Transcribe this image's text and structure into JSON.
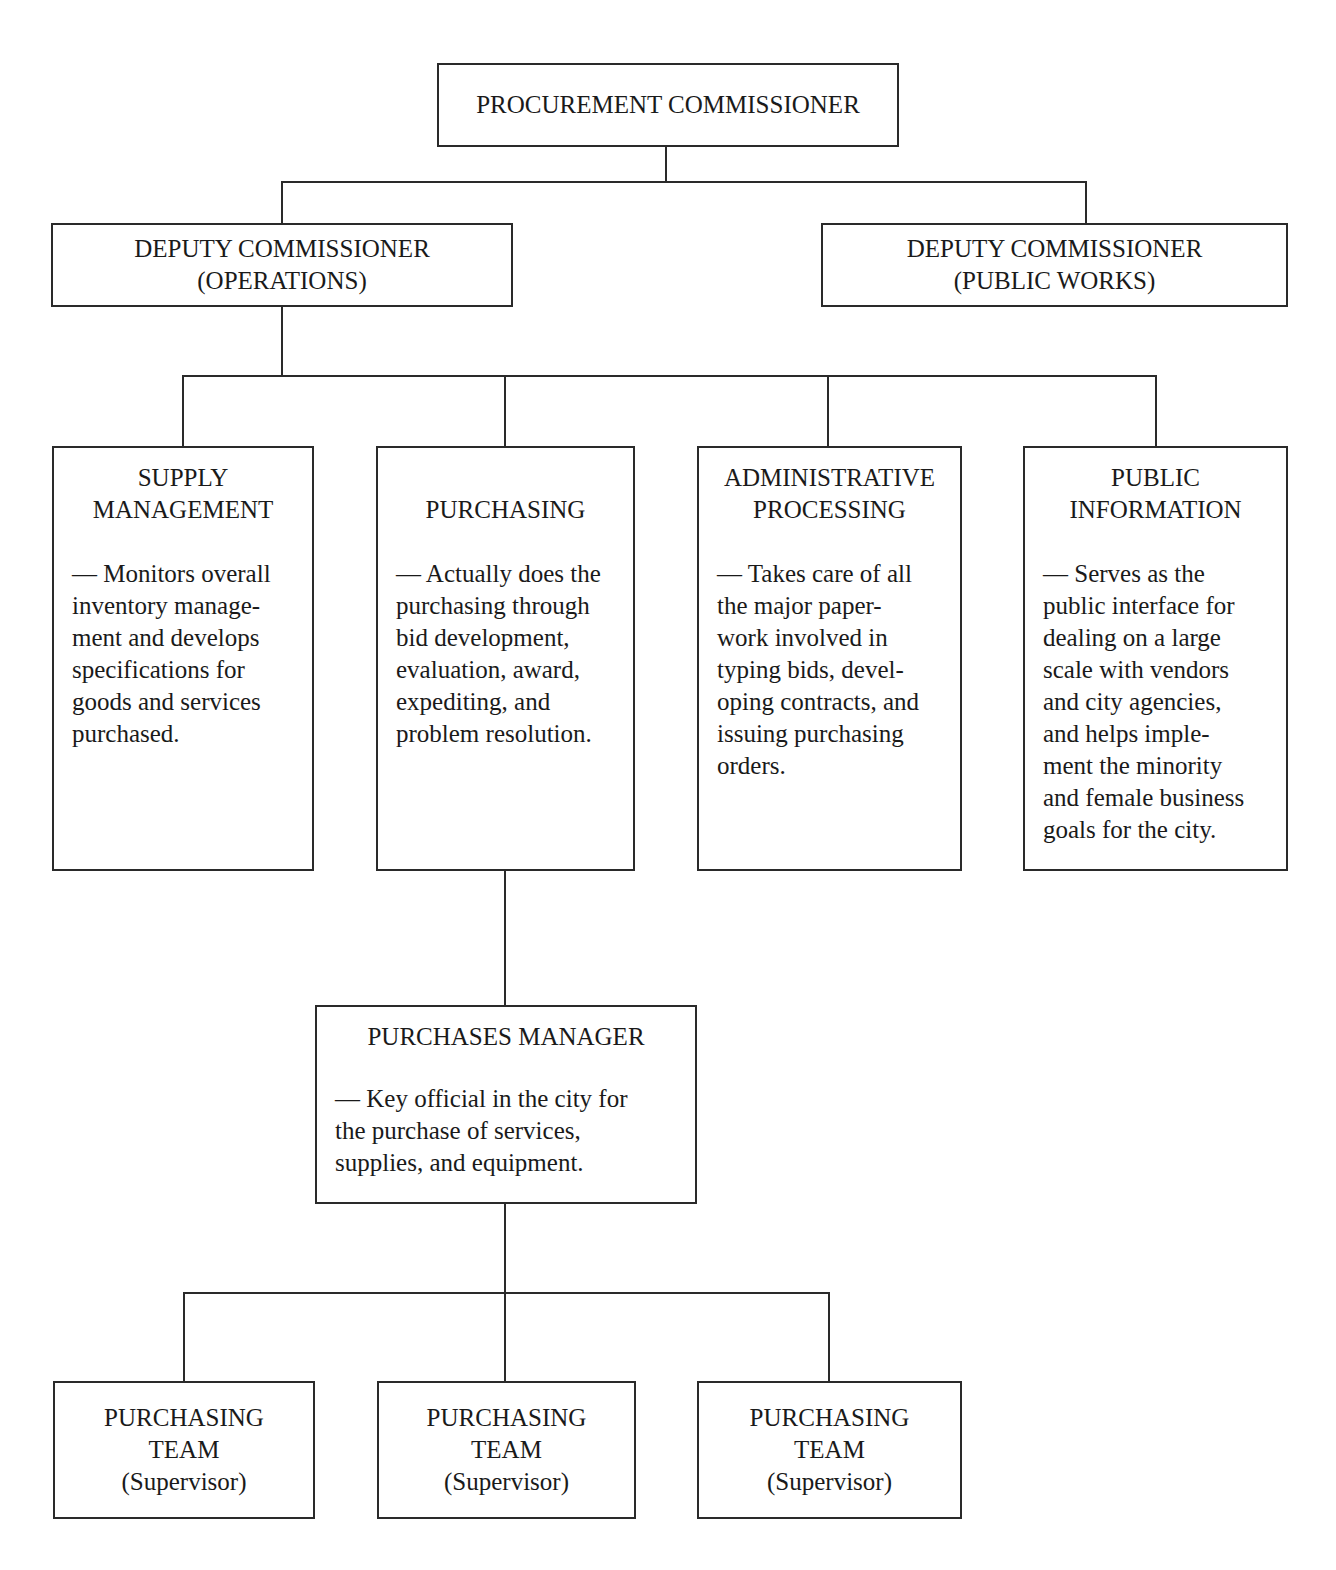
{
  "chart": {
    "top": {
      "title": "PROCUREMENT COMMISSIONER"
    },
    "deputies": [
      {
        "title": "DEPUTY COMMISSIONER\n(OPERATIONS)"
      },
      {
        "title": "DEPUTY COMMISSIONER\n(PUBLIC WORKS)"
      }
    ],
    "divisions": [
      {
        "title": "SUPPLY\nMANAGEMENT",
        "description": "— Monitors overall\ninventory manage-\nment and develops\nspecifications for\ngoods and services\npurchased."
      },
      {
        "title": "\nPURCHASING",
        "description": "— Actually does the\npurchasing through\nbid development,\nevaluation, award,\nexpediting, and\nproblem resolution."
      },
      {
        "title": "ADMINISTRATIVE\nPROCESSING",
        "description": "— Takes care of all\nthe major paper-\nwork involved in\ntyping bids, devel-\noping contracts, and\nissuing purchasing\norders."
      },
      {
        "title": "PUBLIC\nINFORMATION",
        "description": "— Serves as the\npublic interface for\ndealing on a large\nscale with vendors\nand city agencies,\nand helps imple-\nment the minority\nand female business\ngoals for the city."
      }
    ],
    "manager": {
      "title": "PURCHASES MANAGER",
      "description": "— Key official in the city for\nthe purchase of services,\nsupplies, and equipment."
    },
    "teams": [
      {
        "title": "PURCHASING\nTEAM",
        "subtitle": "(Supervisor)"
      },
      {
        "title": "PURCHASING\nTEAM",
        "subtitle": "(Supervisor)"
      },
      {
        "title": "PURCHASING\nTEAM",
        "subtitle": "(Supervisor)"
      }
    ]
  }
}
